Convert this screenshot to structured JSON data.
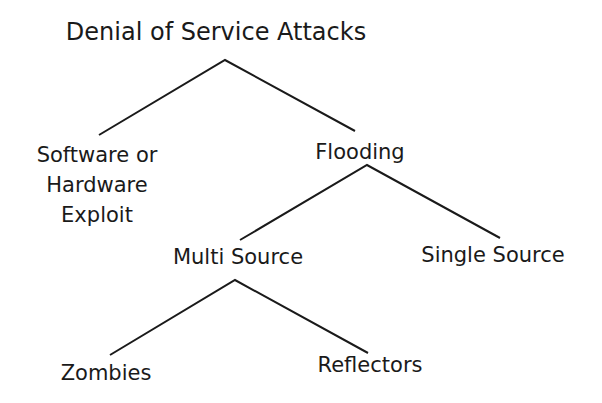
{
  "diagram": {
    "title": "Denial of Service Attacks",
    "nodes": {
      "exploit": [
        "Software or",
        "Hardware",
        "Exploit"
      ],
      "flooding": "Flooding",
      "multi_source": "Multi Source",
      "single_source": "Single Source",
      "zombies": "Zombies",
      "reflectors": "Reflectors"
    },
    "edges": [
      [
        "Denial of Service Attacks",
        "Software or Hardware Exploit"
      ],
      [
        "Denial of Service Attacks",
        "Flooding"
      ],
      [
        "Flooding",
        "Multi Source"
      ],
      [
        "Flooding",
        "Single Source"
      ],
      [
        "Multi Source",
        "Zombies"
      ],
      [
        "Multi Source",
        "Reflectors"
      ]
    ],
    "line_color": "#1a1a1a"
  }
}
